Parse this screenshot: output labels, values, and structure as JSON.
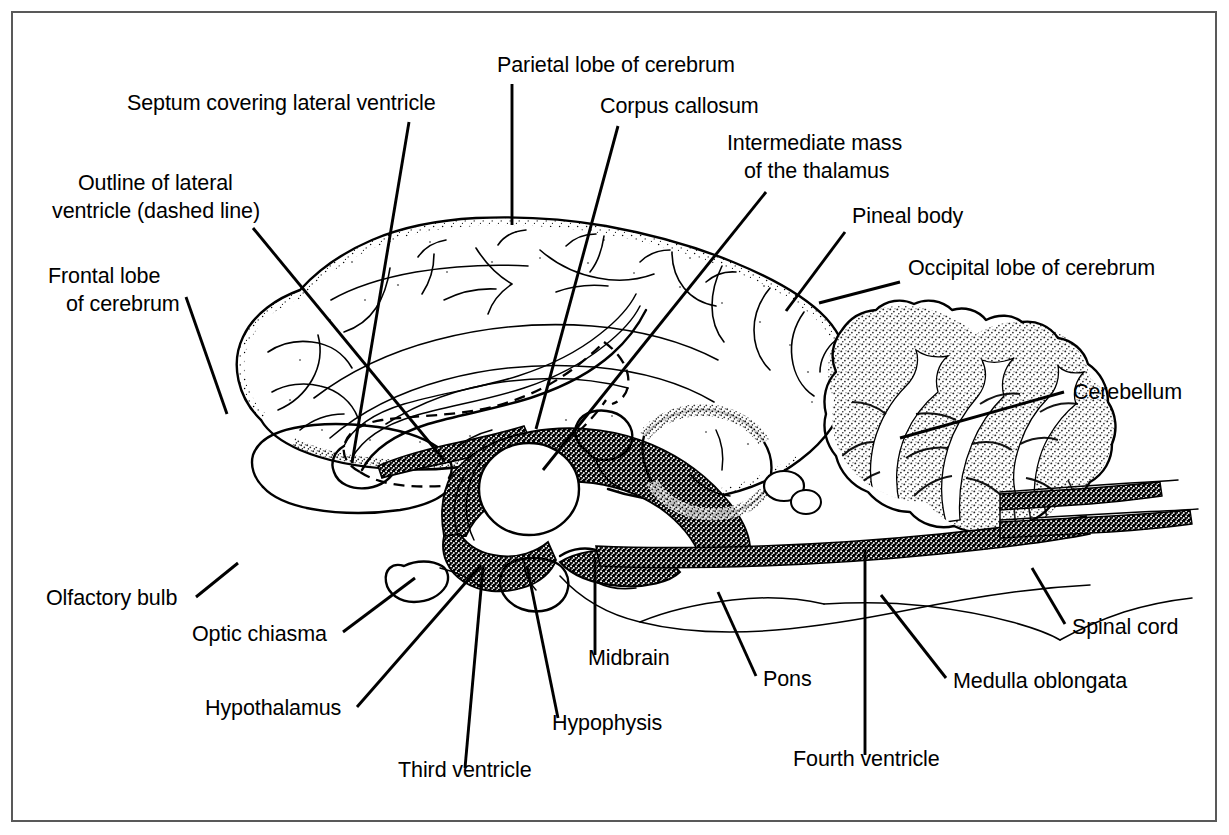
{
  "figure": {
    "border_color": "#595959",
    "background_color": "#ffffff",
    "ink_color": "#000000",
    "width": 1229,
    "height": 835
  },
  "labels": [
    {
      "id": "septum-covering-lateral-ventricle",
      "text": "Septum covering lateral ventricle",
      "x": 127,
      "y": 110,
      "anchor": "start"
    },
    {
      "id": "parietal-lobe-of-cerebrum",
      "text": "Parietal lobe of cerebrum",
      "x": 497,
      "y": 72,
      "anchor": "start"
    },
    {
      "id": "corpus-callosum",
      "text": "Corpus callosum",
      "x": 600,
      "y": 113,
      "anchor": "start"
    },
    {
      "id": "intermediate-mass-of-the-thalamus-line1",
      "text": "Intermediate mass",
      "x": 727,
      "y": 150,
      "anchor": "start"
    },
    {
      "id": "intermediate-mass-of-the-thalamus-line2",
      "text": "of the thalamus",
      "x": 744,
      "y": 178,
      "anchor": "start"
    },
    {
      "id": "pineal-body",
      "text": "Pineal body",
      "x": 852,
      "y": 223,
      "anchor": "start"
    },
    {
      "id": "occipital-lobe-of-cerebrum",
      "text": "Occipital lobe of cerebrum",
      "x": 908,
      "y": 275,
      "anchor": "start"
    },
    {
      "id": "outline-of-lateral-ventricle-line1",
      "text": "Outline of lateral",
      "x": 78,
      "y": 190,
      "anchor": "start"
    },
    {
      "id": "outline-of-lateral-ventricle-line2",
      "text": "ventricle (dashed line)",
      "x": 52,
      "y": 218,
      "anchor": "start"
    },
    {
      "id": "frontal-lobe-of-cerebrum-line1",
      "text": "Frontal lobe",
      "x": 48,
      "y": 283,
      "anchor": "start"
    },
    {
      "id": "frontal-lobe-of-cerebrum-line2",
      "text": "of cerebrum",
      "x": 66,
      "y": 311,
      "anchor": "start"
    },
    {
      "id": "cerebellum",
      "text": "Cerebellum",
      "x": 1073,
      "y": 399,
      "anchor": "start"
    },
    {
      "id": "olfactory-bulb",
      "text": "Olfactory bulb",
      "x": 46,
      "y": 605,
      "anchor": "start"
    },
    {
      "id": "optic-chiasma",
      "text": "Optic chiasma",
      "x": 192,
      "y": 641,
      "anchor": "start"
    },
    {
      "id": "hypothalamus",
      "text": "Hypothalamus",
      "x": 205,
      "y": 715,
      "anchor": "start"
    },
    {
      "id": "third-ventricle",
      "text": "Third ventricle",
      "x": 398,
      "y": 777,
      "anchor": "start"
    },
    {
      "id": "hypophysis",
      "text": "Hypophysis",
      "x": 552,
      "y": 730,
      "anchor": "start"
    },
    {
      "id": "midbrain",
      "text": "Midbrain",
      "x": 588,
      "y": 665,
      "anchor": "start"
    },
    {
      "id": "pons",
      "text": "Pons",
      "x": 763,
      "y": 686,
      "anchor": "start"
    },
    {
      "id": "fourth-ventricle",
      "text": "Fourth ventricle",
      "x": 793,
      "y": 766,
      "anchor": "start"
    },
    {
      "id": "medulla-oblongata",
      "text": "Medulla oblongata",
      "x": 953,
      "y": 688,
      "anchor": "start"
    },
    {
      "id": "spinal-cord",
      "text": "Spinal cord",
      "x": 1072,
      "y": 634,
      "anchor": "start"
    }
  ],
  "leader_lines": [
    {
      "id": "leader-septum",
      "points": "409,122 352,463"
    },
    {
      "id": "leader-parietal",
      "points": "512,84 512,225"
    },
    {
      "id": "leader-corpus-callosum",
      "points": "618,126 536,429"
    },
    {
      "id": "leader-intermediate-mass",
      "points": "766,192 543,470"
    },
    {
      "id": "leader-pineal-body",
      "points": "845,232 786,311"
    },
    {
      "id": "leader-occipital",
      "points": "900,282 819,303"
    },
    {
      "id": "leader-outline-lateral-ventricle",
      "points": "253,228 444,460"
    },
    {
      "id": "leader-frontal-lobe",
      "points": "186,297 227,414"
    },
    {
      "id": "leader-cerebellum",
      "points": "1064,392 900,438"
    },
    {
      "id": "leader-olfactory-bulb",
      "points": "196,597 238,563"
    },
    {
      "id": "leader-optic-chiasma",
      "points": "343,632 415,578"
    },
    {
      "id": "leader-hypothalamus",
      "points": "357,707 481,565"
    },
    {
      "id": "leader-third-ventricle",
      "points": "465,768 483,567"
    },
    {
      "id": "leader-hypophysis",
      "points": "558,718 527,566"
    },
    {
      "id": "leader-midbrain",
      "points": "595,655 595,557"
    },
    {
      "id": "leader-pons",
      "points": "756,676 718,592"
    },
    {
      "id": "leader-fourth-ventricle",
      "points": "865,755 865,549"
    },
    {
      "id": "leader-medulla-oblongata",
      "points": "946,678 881,595"
    },
    {
      "id": "leader-spinal-cord",
      "points": "1065,624 1032,568"
    }
  ],
  "structures": [
    {
      "id": "cerebrum",
      "name": "cerebrum"
    },
    {
      "id": "corpus-callosum-body",
      "name": "corpus callosum"
    },
    {
      "id": "lateral-ventricle-outline",
      "name": "lateral ventricle (dashed outline)"
    },
    {
      "id": "septum-pellucidum",
      "name": "septum covering lateral ventricle"
    },
    {
      "id": "thalamus-intermediate-mass",
      "name": "intermediate mass of the thalamus"
    },
    {
      "id": "pineal-body-structure",
      "name": "pineal body"
    },
    {
      "id": "cerebellum-structure",
      "name": "cerebellum"
    },
    {
      "id": "midbrain-structure",
      "name": "midbrain"
    },
    {
      "id": "pons-structure",
      "name": "pons"
    },
    {
      "id": "medulla-oblongata-structure",
      "name": "medulla oblongata"
    },
    {
      "id": "spinal-cord-structure",
      "name": "spinal cord"
    },
    {
      "id": "hypophysis-structure",
      "name": "hypophysis"
    },
    {
      "id": "optic-chiasma-structure",
      "name": "optic chiasma"
    },
    {
      "id": "olfactory-bulb-structure",
      "name": "olfactory bulb"
    },
    {
      "id": "third-ventricle-structure",
      "name": "third ventricle"
    },
    {
      "id": "fourth-ventricle-structure",
      "name": "fourth ventricle"
    },
    {
      "id": "hypothalamus-structure",
      "name": "hypothalamus"
    }
  ]
}
